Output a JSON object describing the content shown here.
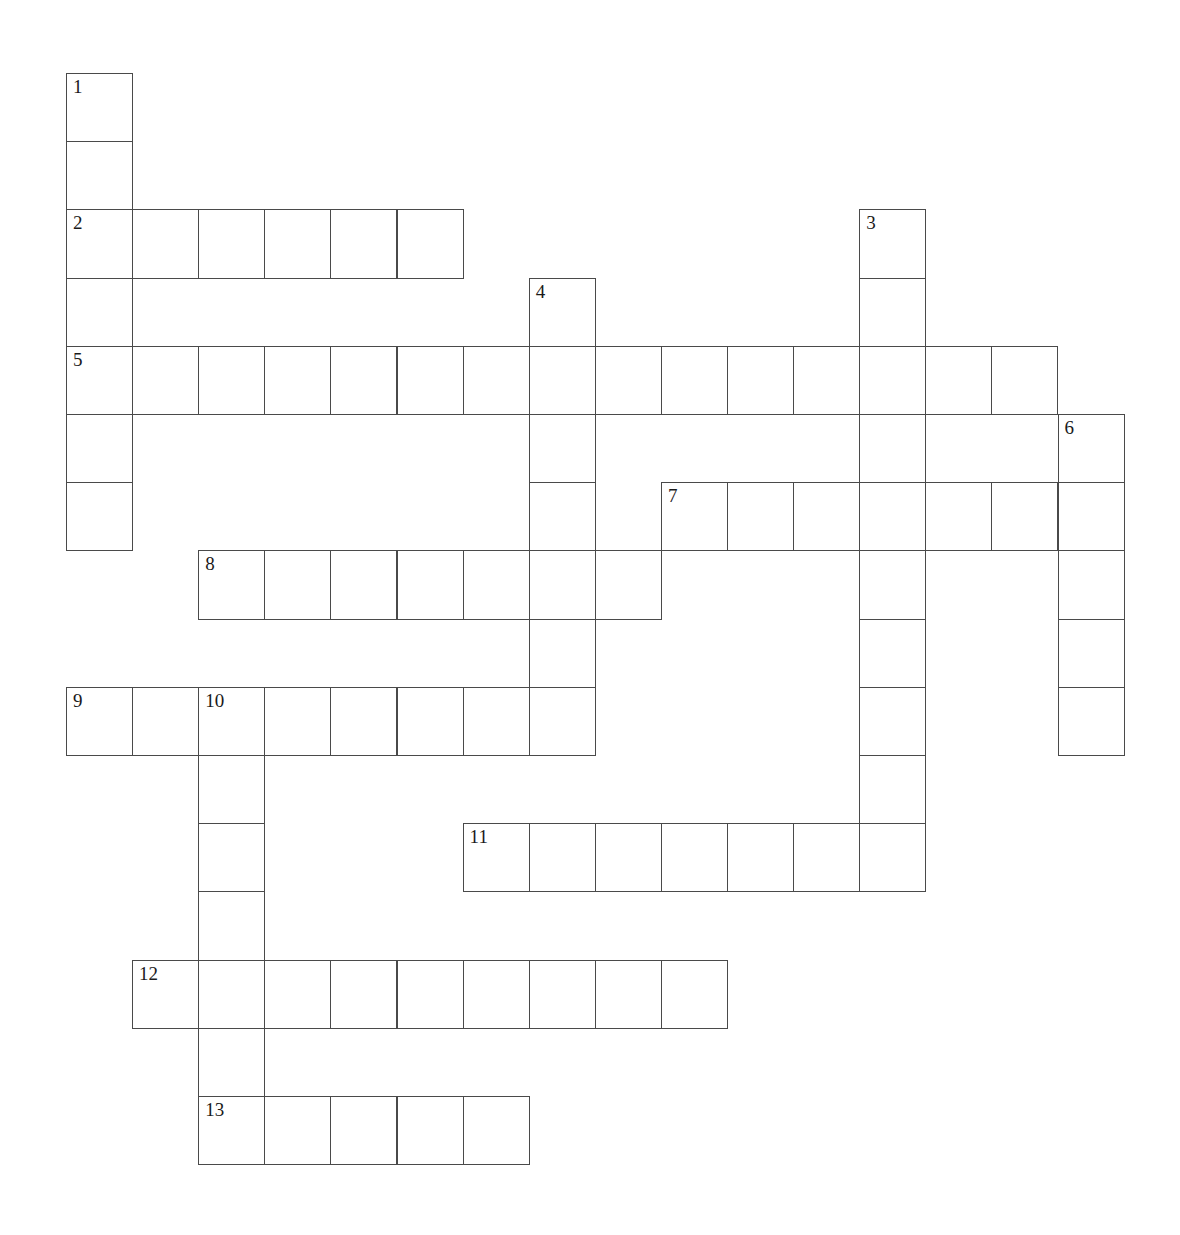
{
  "puzzle": {
    "title": "",
    "grid_origin": {
      "x": 66,
      "y": 73
    },
    "cell_size": {
      "width": 66.1,
      "height": 68.2
    },
    "columns": 16,
    "rows": 16,
    "colors": {
      "cell_border": "#4a4a4a",
      "cell_fill": "#ffffff",
      "number_text": "#1a1a1a",
      "page_background": "#ffffff"
    },
    "entries": [
      {
        "number": "1",
        "direction": "down",
        "row": 0,
        "col": 0,
        "length": 7
      },
      {
        "number": "2",
        "direction": "across",
        "row": 2,
        "col": 0,
        "length": 6
      },
      {
        "number": "3",
        "direction": "down",
        "row": 2,
        "col": 12,
        "length": 10
      },
      {
        "number": "4",
        "direction": "down",
        "row": 3,
        "col": 7,
        "length": 7
      },
      {
        "number": "5",
        "direction": "across",
        "row": 4,
        "col": 0,
        "length": 15
      },
      {
        "number": "6",
        "direction": "down",
        "row": 5,
        "col": 15,
        "length": 5
      },
      {
        "number": "7",
        "direction": "across",
        "row": 6,
        "col": 9,
        "length": 7
      },
      {
        "number": "8",
        "direction": "across",
        "row": 7,
        "col": 2,
        "length": 7
      },
      {
        "number": "9",
        "direction": "across",
        "row": 9,
        "col": 0,
        "length": 8
      },
      {
        "number": "10",
        "direction": "down",
        "row": 9,
        "col": 2,
        "length": 7
      },
      {
        "number": "11",
        "direction": "across",
        "row": 11,
        "col": 6,
        "length": 7
      },
      {
        "number": "12",
        "direction": "across",
        "row": 13,
        "col": 1,
        "length": 9
      },
      {
        "number": "13",
        "direction": "across",
        "row": 15,
        "col": 2,
        "length": 5
      }
    ],
    "cells": [
      {
        "row": 0,
        "col": 0,
        "number": "1",
        "letter": ""
      },
      {
        "row": 1,
        "col": 0,
        "number": "",
        "letter": ""
      },
      {
        "row": 2,
        "col": 0,
        "number": "2",
        "letter": ""
      },
      {
        "row": 2,
        "col": 1,
        "number": "",
        "letter": ""
      },
      {
        "row": 2,
        "col": 2,
        "number": "",
        "letter": ""
      },
      {
        "row": 2,
        "col": 3,
        "number": "",
        "letter": ""
      },
      {
        "row": 2,
        "col": 4,
        "number": "",
        "letter": ""
      },
      {
        "row": 2,
        "col": 5,
        "number": "",
        "letter": ""
      },
      {
        "row": 2,
        "col": 12,
        "number": "3",
        "letter": ""
      },
      {
        "row": 3,
        "col": 0,
        "number": "",
        "letter": ""
      },
      {
        "row": 3,
        "col": 7,
        "number": "4",
        "letter": ""
      },
      {
        "row": 3,
        "col": 12,
        "number": "",
        "letter": ""
      },
      {
        "row": 4,
        "col": 0,
        "number": "5",
        "letter": ""
      },
      {
        "row": 4,
        "col": 1,
        "number": "",
        "letter": ""
      },
      {
        "row": 4,
        "col": 2,
        "number": "",
        "letter": ""
      },
      {
        "row": 4,
        "col": 3,
        "number": "",
        "letter": ""
      },
      {
        "row": 4,
        "col": 4,
        "number": "",
        "letter": ""
      },
      {
        "row": 4,
        "col": 5,
        "number": "",
        "letter": ""
      },
      {
        "row": 4,
        "col": 6,
        "number": "",
        "letter": ""
      },
      {
        "row": 4,
        "col": 7,
        "number": "",
        "letter": ""
      },
      {
        "row": 4,
        "col": 8,
        "number": "",
        "letter": ""
      },
      {
        "row": 4,
        "col": 9,
        "number": "",
        "letter": ""
      },
      {
        "row": 4,
        "col": 10,
        "number": "",
        "letter": ""
      },
      {
        "row": 4,
        "col": 11,
        "number": "",
        "letter": ""
      },
      {
        "row": 4,
        "col": 12,
        "number": "",
        "letter": ""
      },
      {
        "row": 4,
        "col": 13,
        "number": "",
        "letter": ""
      },
      {
        "row": 4,
        "col": 14,
        "number": "",
        "letter": ""
      },
      {
        "row": 5,
        "col": 0,
        "number": "",
        "letter": ""
      },
      {
        "row": 5,
        "col": 7,
        "number": "",
        "letter": ""
      },
      {
        "row": 5,
        "col": 12,
        "number": "",
        "letter": ""
      },
      {
        "row": 5,
        "col": 15,
        "number": "6",
        "letter": ""
      },
      {
        "row": 6,
        "col": 0,
        "number": "",
        "letter": ""
      },
      {
        "row": 6,
        "col": 7,
        "number": "",
        "letter": ""
      },
      {
        "row": 6,
        "col": 9,
        "number": "7",
        "letter": ""
      },
      {
        "row": 6,
        "col": 10,
        "number": "",
        "letter": ""
      },
      {
        "row": 6,
        "col": 11,
        "number": "",
        "letter": ""
      },
      {
        "row": 6,
        "col": 12,
        "number": "",
        "letter": ""
      },
      {
        "row": 6,
        "col": 13,
        "number": "",
        "letter": ""
      },
      {
        "row": 6,
        "col": 14,
        "number": "",
        "letter": ""
      },
      {
        "row": 6,
        "col": 15,
        "number": "",
        "letter": ""
      },
      {
        "row": 7,
        "col": 2,
        "number": "8",
        "letter": ""
      },
      {
        "row": 7,
        "col": 3,
        "number": "",
        "letter": ""
      },
      {
        "row": 7,
        "col": 4,
        "number": "",
        "letter": ""
      },
      {
        "row": 7,
        "col": 5,
        "number": "",
        "letter": ""
      },
      {
        "row": 7,
        "col": 6,
        "number": "",
        "letter": ""
      },
      {
        "row": 7,
        "col": 7,
        "number": "",
        "letter": ""
      },
      {
        "row": 7,
        "col": 8,
        "number": "",
        "letter": ""
      },
      {
        "row": 7,
        "col": 12,
        "number": "",
        "letter": ""
      },
      {
        "row": 7,
        "col": 15,
        "number": "",
        "letter": ""
      },
      {
        "row": 8,
        "col": 7,
        "number": "",
        "letter": ""
      },
      {
        "row": 8,
        "col": 12,
        "number": "",
        "letter": ""
      },
      {
        "row": 8,
        "col": 15,
        "number": "",
        "letter": ""
      },
      {
        "row": 9,
        "col": 0,
        "number": "9",
        "letter": ""
      },
      {
        "row": 9,
        "col": 1,
        "number": "",
        "letter": ""
      },
      {
        "row": 9,
        "col": 2,
        "number": "10",
        "letter": ""
      },
      {
        "row": 9,
        "col": 3,
        "number": "",
        "letter": ""
      },
      {
        "row": 9,
        "col": 4,
        "number": "",
        "letter": ""
      },
      {
        "row": 9,
        "col": 5,
        "number": "",
        "letter": ""
      },
      {
        "row": 9,
        "col": 6,
        "number": "",
        "letter": ""
      },
      {
        "row": 9,
        "col": 7,
        "number": "",
        "letter": ""
      },
      {
        "row": 9,
        "col": 12,
        "number": "",
        "letter": ""
      },
      {
        "row": 9,
        "col": 15,
        "number": "",
        "letter": ""
      },
      {
        "row": 10,
        "col": 2,
        "number": "",
        "letter": ""
      },
      {
        "row": 10,
        "col": 12,
        "number": "",
        "letter": ""
      },
      {
        "row": 11,
        "col": 2,
        "number": "",
        "letter": ""
      },
      {
        "row": 11,
        "col": 6,
        "number": "11",
        "letter": ""
      },
      {
        "row": 11,
        "col": 7,
        "number": "",
        "letter": ""
      },
      {
        "row": 11,
        "col": 8,
        "number": "",
        "letter": ""
      },
      {
        "row": 11,
        "col": 9,
        "number": "",
        "letter": ""
      },
      {
        "row": 11,
        "col": 10,
        "number": "",
        "letter": ""
      },
      {
        "row": 11,
        "col": 11,
        "number": "",
        "letter": ""
      },
      {
        "row": 11,
        "col": 12,
        "number": "",
        "letter": ""
      },
      {
        "row": 12,
        "col": 2,
        "number": "",
        "letter": ""
      },
      {
        "row": 13,
        "col": 1,
        "number": "12",
        "letter": ""
      },
      {
        "row": 13,
        "col": 2,
        "number": "",
        "letter": ""
      },
      {
        "row": 13,
        "col": 3,
        "number": "",
        "letter": ""
      },
      {
        "row": 13,
        "col": 4,
        "number": "",
        "letter": ""
      },
      {
        "row": 13,
        "col": 5,
        "number": "",
        "letter": ""
      },
      {
        "row": 13,
        "col": 6,
        "number": "",
        "letter": ""
      },
      {
        "row": 13,
        "col": 7,
        "number": "",
        "letter": ""
      },
      {
        "row": 13,
        "col": 8,
        "number": "",
        "letter": ""
      },
      {
        "row": 13,
        "col": 9,
        "number": "",
        "letter": ""
      },
      {
        "row": 14,
        "col": 2,
        "number": "",
        "letter": ""
      },
      {
        "row": 15,
        "col": 2,
        "number": "13",
        "letter": ""
      },
      {
        "row": 15,
        "col": 3,
        "number": "",
        "letter": ""
      },
      {
        "row": 15,
        "col": 4,
        "number": "",
        "letter": ""
      },
      {
        "row": 15,
        "col": 5,
        "number": "",
        "letter": ""
      },
      {
        "row": 15,
        "col": 6,
        "number": "",
        "letter": ""
      }
    ]
  }
}
